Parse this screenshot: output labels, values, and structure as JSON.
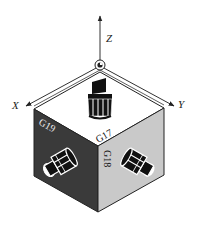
{
  "figure": {
    "title": "",
    "axes": {
      "z": "Z",
      "x": "X",
      "y": "Y"
    },
    "planes": {
      "top": "G17",
      "left": "G19",
      "right": "G18"
    },
    "colors": {
      "background": "#ffffff",
      "top_face": "#ffffff",
      "left_face": "#3a3a3a",
      "right_face": "#c9c9c9",
      "axis_line": "#333333",
      "tool": "#111111"
    }
  }
}
